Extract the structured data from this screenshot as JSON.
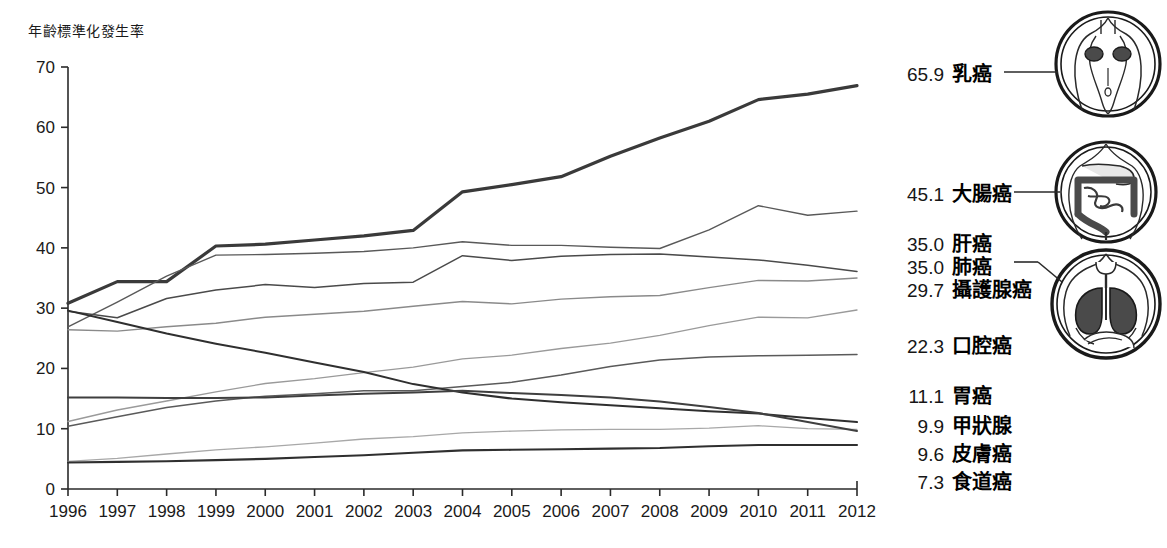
{
  "figure": {
    "y_axis_title": "年齡標準化發生率",
    "background": "#ffffff",
    "ink": "#1a1a1a"
  },
  "legend": {
    "items": [
      {
        "value": "65.9",
        "label": "乳癌",
        "icon": "breast-torso-icon",
        "connector": true
      },
      {
        "value": "45.1",
        "label": "大腸癌",
        "icon": "colon-icon",
        "connector": true
      },
      {
        "value": "35.0",
        "label": "肝癌",
        "icon": "",
        "connector": false
      },
      {
        "value": "35.0",
        "label": "肺癌",
        "icon": "lungs-icon",
        "connector": true
      },
      {
        "value": "29.7",
        "label": "攝護腺癌",
        "icon": "",
        "connector": false
      },
      {
        "value": "22.3",
        "label": "口腔癌",
        "icon": "",
        "connector": false
      },
      {
        "value": "11.1",
        "label": "胃癌",
        "icon": "",
        "connector": false
      },
      {
        "value": "9.9",
        "label": "甲狀腺",
        "icon": "",
        "connector": false
      },
      {
        "value": "9.6",
        "label": "皮膚癌",
        "icon": "",
        "connector": false
      },
      {
        "value": "7.3",
        "label": "食道癌",
        "icon": "",
        "connector": false
      }
    ]
  },
  "chart_data": {
    "type": "line",
    "title": "",
    "xlabel": "",
    "ylabel": "年齡標準化發生率",
    "xlim": [
      1996,
      2012
    ],
    "ylim": [
      0,
      70
    ],
    "yticks": [
      0,
      10,
      20,
      30,
      40,
      50,
      60,
      70
    ],
    "grid": false,
    "legend_position": "right",
    "x": [
      1996,
      1997,
      1998,
      1999,
      2000,
      2001,
      2002,
      2003,
      2004,
      2005,
      2006,
      2007,
      2008,
      2009,
      2010,
      2011,
      2012
    ],
    "series": [
      {
        "name": "乳癌",
        "end_value": 65.9,
        "color": "#3a3a3a",
        "width": 3.2,
        "values": [
          30.8,
          34.4,
          34.4,
          40.3,
          40.6,
          41.3,
          42.0,
          42.9,
          49.3,
          50.5,
          51.8,
          55.2,
          58.2,
          61.0,
          64.6,
          65.5,
          66.9
        ]
      },
      {
        "name": "大腸癌",
        "end_value": 45.1,
        "color": "#595959",
        "width": 1.4,
        "values": [
          26.9,
          31.0,
          35.3,
          38.8,
          38.9,
          39.1,
          39.4,
          40.0,
          41.0,
          40.4,
          40.4,
          40.1,
          39.9,
          43.0,
          47.0,
          45.4,
          46.1
        ]
      },
      {
        "name": "肝癌",
        "end_value": 35.0,
        "color": "#4a4a4a",
        "width": 1.5,
        "values": [
          29.5,
          28.4,
          31.6,
          33.0,
          33.9,
          33.4,
          34.1,
          34.3,
          38.7,
          37.9,
          38.6,
          38.9,
          39.0,
          38.5,
          38.0,
          37.1,
          36.1
        ]
      },
      {
        "name": "肺癌",
        "end_value": 35.0,
        "color": "#8a8a8a",
        "width": 1.4,
        "values": [
          26.4,
          26.2,
          26.9,
          27.5,
          28.5,
          29.0,
          29.5,
          30.3,
          31.1,
          30.7,
          31.5,
          31.9,
          32.1,
          33.4,
          34.6,
          34.5,
          35.0
        ]
      },
      {
        "name": "攝護腺癌",
        "end_value": 29.7,
        "color": "#9a9a9a",
        "width": 1.3,
        "values": [
          11.2,
          13.1,
          14.6,
          16.1,
          17.5,
          18.3,
          19.3,
          20.2,
          21.6,
          22.2,
          23.3,
          24.2,
          25.5,
          27.1,
          28.5,
          28.4,
          29.7
        ]
      },
      {
        "name": "口腔癌",
        "end_value": 22.3,
        "color": "#5a5a5a",
        "width": 1.5,
        "values": [
          10.4,
          12.0,
          13.5,
          14.6,
          15.4,
          15.8,
          16.3,
          16.3,
          17.0,
          17.7,
          18.9,
          20.3,
          21.4,
          21.9,
          22.1,
          22.2,
          22.3
        ]
      },
      {
        "name": "胃癌",
        "end_value": 11.1,
        "color": "#2f2f2f",
        "width": 2.0,
        "values": [
          29.6,
          27.7,
          25.8,
          24.1,
          22.6,
          21.0,
          19.4,
          17.4,
          16.0,
          15.0,
          14.4,
          13.9,
          13.4,
          12.9,
          12.5,
          11.8,
          11.1
        ]
      },
      {
        "name": "甲狀腺",
        "end_value": 9.9,
        "color": "#a8a8a8",
        "width": 1.3,
        "values": [
          4.6,
          5.1,
          5.8,
          6.5,
          7.0,
          7.6,
          8.3,
          8.7,
          9.3,
          9.6,
          9.8,
          9.9,
          9.9,
          10.1,
          10.5,
          10.0,
          9.9
        ]
      },
      {
        "name": "皮膚癌",
        "end_value": 9.6,
        "color": "#3f3f3f",
        "width": 2.0,
        "values": [
          15.2,
          15.2,
          15.1,
          15.1,
          15.2,
          15.5,
          15.8,
          16.0,
          16.3,
          15.9,
          15.6,
          15.2,
          14.5,
          13.6,
          12.6,
          11.1,
          9.6
        ]
      },
      {
        "name": "食道癌",
        "end_value": 7.3,
        "color": "#2f2f2f",
        "width": 2.1,
        "values": [
          4.4,
          4.5,
          4.6,
          4.8,
          5.0,
          5.3,
          5.6,
          6.0,
          6.4,
          6.5,
          6.6,
          6.7,
          6.8,
          7.1,
          7.3,
          7.3,
          7.3
        ]
      }
    ]
  }
}
